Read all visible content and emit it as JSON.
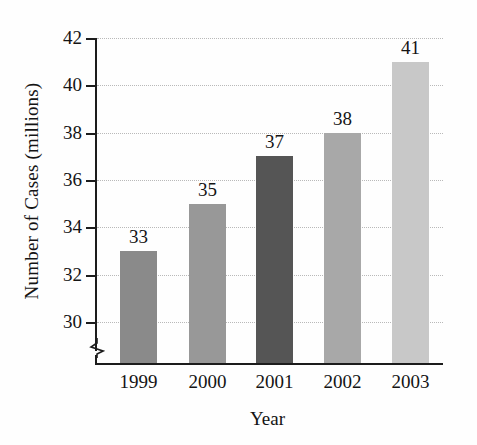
{
  "chart_data": {
    "type": "bar",
    "title": "",
    "xlabel": "Year",
    "ylabel": "Number of Cases (millions)",
    "categories": [
      "1999",
      "2000",
      "2001",
      "2002",
      "2003"
    ],
    "values": [
      33,
      35,
      37,
      38,
      41
    ],
    "value_labels": [
      "33",
      "35",
      "37",
      "38",
      "41"
    ],
    "ylim": [
      30,
      42
    ],
    "y_ticks": [
      42,
      40,
      38,
      36,
      34,
      32,
      30
    ],
    "y_tick_labels": [
      "42",
      "40",
      "38",
      "36",
      "34",
      "32",
      "30"
    ],
    "axis_break": true,
    "grid": true,
    "grid_style": "dotted-horizontal",
    "legend": "none",
    "bar_colors": [
      "#8a8a8a",
      "#989898",
      "#555555",
      "#a8a8a8",
      "#c8c8c8"
    ],
    "bars": [
      {
        "category": "1999",
        "value": 33,
        "label": "33",
        "color": "#8a8a8a"
      },
      {
        "category": "2000",
        "value": 35,
        "label": "35",
        "color": "#989898"
      },
      {
        "category": "2001",
        "value": 37,
        "label": "37",
        "color": "#555555"
      },
      {
        "category": "2002",
        "value": 38,
        "label": "38",
        "color": "#a8a8a8"
      },
      {
        "category": "2003",
        "value": 41,
        "label": "41",
        "color": "#c8c8c8"
      }
    ]
  }
}
